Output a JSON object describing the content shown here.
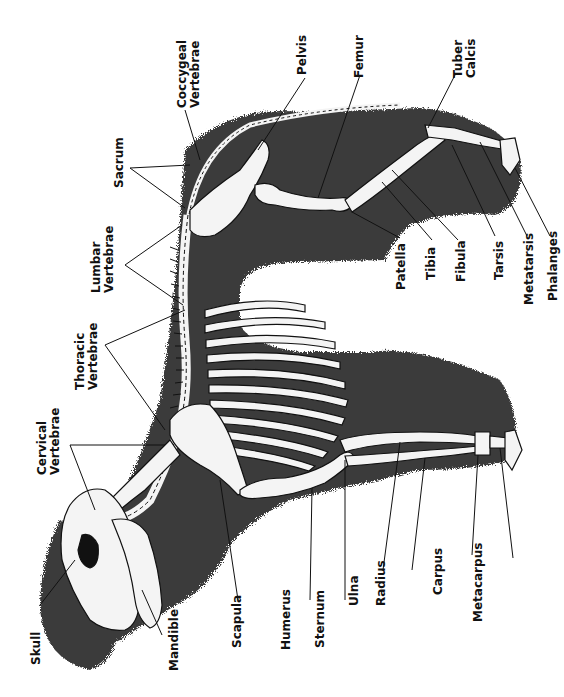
{
  "figure": {
    "colors": {
      "wool": "#3a3a3a",
      "bone": "#f4f4f4",
      "outline": "#111111",
      "background": "#ffffff",
      "label": "#111111"
    }
  },
  "labels": {
    "skull": "Skull",
    "mandible": "Mandible",
    "cervical_1": "Cervical",
    "cervical_2": "Vertebrae",
    "thoracic_1": "Thoracic",
    "thoracic_2": "Vertebrae",
    "lumbar_1": "Lumbar",
    "lumbar_2": "Vertebrae",
    "sacrum": "Sacrum",
    "coccygeal_1": "Coccygeal",
    "coccygeal_2": "Vertebrae",
    "pelvis": "Pelvis",
    "femur": "Femur",
    "tuber_1": "Tuber",
    "tuber_2": "Calcis",
    "patella": "Patella",
    "tibia": "Tibia",
    "fibula": "Fibula",
    "tarsis": "Tarsis",
    "metatarsis": "Metatarsis",
    "phalanges": "Phalanges",
    "scapula": "Scapula",
    "humerus": "Humerus",
    "sternum": "Sternum",
    "ulna": "Ulna",
    "radius": "Radius",
    "carpus": "Carpus",
    "metacarpus": "Metacarpus"
  }
}
